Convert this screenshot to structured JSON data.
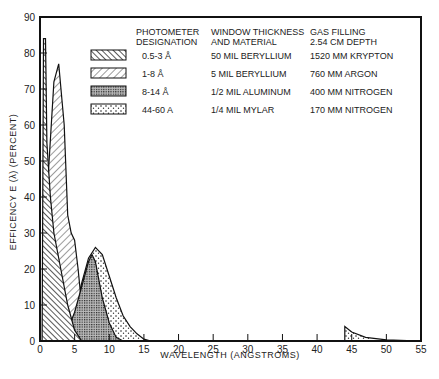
{
  "chart_data": {
    "type": "area",
    "title": "",
    "xlabel": "WAVELENGTH (ANGSTROMS)",
    "ylabel": "EFFICENCY E (λ) (PERCENT)",
    "xlim": [
      0,
      55
    ],
    "ylim": [
      0,
      90
    ],
    "x_ticks": [
      "0",
      "5",
      "10",
      "15",
      "20",
      "25",
      "30",
      "35",
      "40",
      "45",
      "50",
      "55"
    ],
    "y_ticks": [
      "0",
      "10",
      "20",
      "30",
      "40",
      "50",
      "60",
      "70",
      "80",
      "90"
    ],
    "grid": false,
    "legend_position": "upper right (inside plot)",
    "legend_headers": {
      "designation": "PHOTOMETER DESIGNATION",
      "window": "WINDOW THICKNESS AND MATERIAL",
      "gas": "GAS FILLING 2.54 CM DEPTH"
    },
    "series": [
      {
        "name": "0.5-3 Å",
        "window": "50 MIL BERYLLIUM",
        "gas": "1520 MM KRYPTON",
        "pattern": "dense back-diagonal hatch",
        "x": [
          0.3,
          0.5,
          0.8,
          1.0,
          1.5,
          2.0,
          3.0,
          4.0,
          5.0,
          6.0
        ],
        "values": [
          0,
          84,
          84,
          55,
          40,
          30,
          20,
          10,
          3,
          0
        ]
      },
      {
        "name": "1-8 Å",
        "window": "5 MIL BERYLLIUM",
        "gas": "760 MM ARGON",
        "pattern": "forward-diagonal hatch",
        "x": [
          0.5,
          1.0,
          2.0,
          2.7,
          3.5,
          4.0,
          4.5,
          5.0,
          5.5,
          6.0,
          7.0
        ],
        "values": [
          0,
          40,
          72,
          77,
          60,
          35,
          30,
          28,
          20,
          10,
          0
        ]
      },
      {
        "name": "8-14 Å",
        "window": "1/2 MIL ALUMINUM",
        "gas": "400 MM NITROGEN",
        "pattern": "fine cross-dot",
        "x": [
          0.5,
          2.0,
          3.0,
          4.0,
          5.0,
          6.0,
          7.0,
          7.5,
          8.0,
          9.0,
          10.0,
          11.0,
          12.0
        ],
        "values": [
          0,
          3,
          4,
          3,
          8,
          15,
          22,
          24,
          22,
          12,
          5,
          1,
          0
        ]
      },
      {
        "name": "44-60 A",
        "window": "1/4 MIL MYLAR",
        "gas": "170 MM NITROGEN",
        "pattern": "sparse stipple",
        "x": [
          3.0,
          5.0,
          6.0,
          7.0,
          8.0,
          9.0,
          10.0,
          11.0,
          12.0,
          13.0,
          14.0,
          15.0,
          16.0,
          44.0,
          45.0,
          47.0,
          50.0,
          55.0
        ],
        "values": [
          0,
          8,
          16,
          23,
          26,
          24,
          18,
          12,
          7,
          4,
          2,
          0.5,
          0,
          4,
          2.5,
          1,
          0.3,
          0
        ]
      }
    ]
  }
}
